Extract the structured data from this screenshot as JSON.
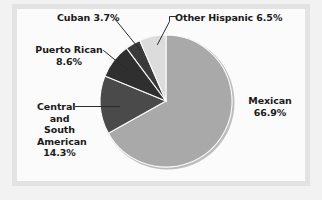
{
  "figure": {
    "background_color": "#f2f2f2",
    "frame_color": "#e3e3e3",
    "panel_color": "#fbfbfb",
    "text_color": "#1a1a1a",
    "leader_line_color": "#2b2b2b"
  },
  "chart_data": {
    "type": "pie",
    "title": "",
    "subtitle": "",
    "xlabel": "",
    "ylabel": "",
    "legend_position": "none",
    "grid": false,
    "labels_placement": "outside-with-leader-lines",
    "start_angle_deg": 90,
    "direction": "clockwise",
    "units": "percent",
    "categories": [
      "Mexican",
      "Central and South American",
      "Puerto Rican",
      "Cuban",
      "Other Hispanic"
    ],
    "values": [
      66.9,
      14.3,
      8.6,
      3.7,
      6.5
    ],
    "slice_colors": [
      "#a9a9a9",
      "#4a4a4a",
      "#2f2f2f",
      "#3a3a3a",
      "#dcdcdc"
    ],
    "slices": [
      {
        "name": "Mexican",
        "value": 66.9,
        "value_label": "66.9%",
        "label_lines": [
          "Mexican",
          "66.9%"
        ],
        "color": "#a9a9a9"
      },
      {
        "name": "Central and South American",
        "value": 14.3,
        "value_label": "14.3%",
        "label_lines": [
          "Central",
          "and",
          "South",
          "American",
          "14.3%"
        ],
        "color": "#4a4a4a"
      },
      {
        "name": "Puerto Rican",
        "value": 8.6,
        "value_label": "8.6%",
        "label_lines": [
          "Puerto Rican",
          "8.6%"
        ],
        "color": "#2f2f2f"
      },
      {
        "name": "Cuban",
        "value": 3.7,
        "value_label": "3.7%",
        "label_lines": [
          "Cuban 3.7%"
        ],
        "color": "#3a3a3a"
      },
      {
        "name": "Other Hispanic",
        "value": 6.5,
        "value_label": "6.5%",
        "label_lines": [
          "Other Hispanic 6.5%"
        ],
        "color": "#dcdcdc"
      }
    ]
  },
  "labels": {
    "cuban": "Cuban 3.7%",
    "other_hispanic": "Other Hispanic 6.5%",
    "puerto_rican_line1": "Puerto Rican",
    "puerto_rican_line2": "8.6%",
    "central_line1": "Central",
    "central_line2": "and",
    "central_line3": "South",
    "central_line4": "American",
    "central_line5": "14.3%",
    "mexican_line1": "Mexican",
    "mexican_line2": "66.9%"
  }
}
